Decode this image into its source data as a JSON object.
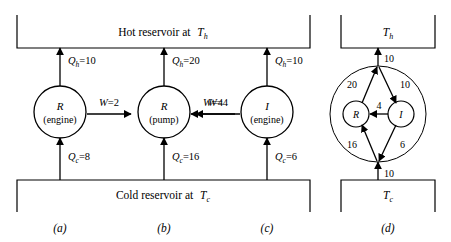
{
  "figure": {
    "reservoirs": {
      "hot_label": "Hot reservoir at",
      "hot_symbol": "T",
      "hot_sub": "h",
      "cold_label": "Cold reservoir at",
      "cold_symbol": "T",
      "cold_sub": "c"
    },
    "panels": [
      {
        "id": "a",
        "caption": "(a)",
        "device_symbol": "R",
        "device_kind": "(engine)",
        "q_hot": {
          "symbol": "Q",
          "sub": "h",
          "eq": "=",
          "value": "10",
          "direction": "down"
        },
        "work": {
          "symbol": "W",
          "eq": "=",
          "value": "2",
          "direction": "right"
        },
        "q_cold": {
          "symbol": "Q",
          "sub": "c",
          "eq": "=",
          "value": "8",
          "direction": "down"
        }
      },
      {
        "id": "b",
        "caption": "(b)",
        "device_symbol": "R",
        "device_kind": "(pump)",
        "q_hot": {
          "symbol": "Q",
          "sub": "h",
          "eq": "=",
          "value": "20",
          "direction": "up"
        },
        "work": {
          "symbol": "W",
          "eq": "=",
          "value": "4",
          "direction": "left"
        },
        "q_cold": {
          "symbol": "Q",
          "sub": "c",
          "eq": "=",
          "value": "16",
          "direction": "up"
        }
      },
      {
        "id": "c",
        "caption": "(c)",
        "device_symbol": "I",
        "device_kind": "(engine)",
        "q_hot": {
          "symbol": "Q",
          "sub": "h",
          "eq": "=",
          "value": "10",
          "direction": "down"
        },
        "work": {
          "symbol": "W",
          "eq": "=",
          "value": "4",
          "direction": "left"
        },
        "q_cold": {
          "symbol": "Q",
          "sub": "c",
          "eq": "=",
          "value": "6",
          "direction": "down"
        }
      }
    ],
    "panel_d": {
      "id": "d",
      "caption": "(d)",
      "hot_symbol": "T",
      "hot_sub": "h",
      "cold_symbol": "T",
      "cold_sub": "c",
      "device_left": "R",
      "device_right": "I",
      "flows": {
        "to_hot": "10",
        "r_to_top": "20",
        "top_to_i": "10",
        "i_to_r": "4",
        "bottom_to_r": "16",
        "i_to_bottom": "6",
        "from_cold": "10"
      }
    }
  }
}
